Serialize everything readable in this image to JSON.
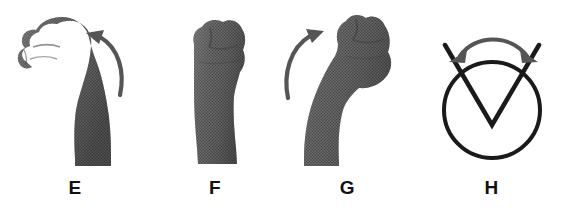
{
  "figure": {
    "background_color": "#ffffff",
    "ink_color": "#4a4a4a",
    "label_color": "#111111",
    "arrow_color": "#555555",
    "symbol_color": "#1a1a1a"
  },
  "panels": [
    {
      "id": "E",
      "label": "E",
      "subject": "fist-wrist-flexion",
      "description": "Clenched fist viewed from the radial side with the wrist bent forward in flexion",
      "has_arrow": true,
      "arrow": {
        "name": "flexion-arrow",
        "style": "curved-single-headed",
        "direction": "counterclockwise-up-left",
        "head_position": "upper-left"
      }
    },
    {
      "id": "F",
      "label": "F",
      "subject": "fist-wrist-neutral",
      "description": "Clenched fist held upright with the wrist in neutral alignment",
      "has_arrow": false
    },
    {
      "id": "G",
      "label": "G",
      "subject": "fist-wrist-extension",
      "description": "Clenched fist with the wrist bent backward in extension",
      "has_arrow": true,
      "arrow": {
        "name": "extension-arrow",
        "style": "curved-single-headed",
        "direction": "clockwise-up-right",
        "head_position": "upper-right"
      }
    },
    {
      "id": "H",
      "label": "H",
      "subject": "goniometer-angle-symbol",
      "description": "Circle crossed by a V-shaped angle with a double-headed arc arrow spanning the opening",
      "has_arrow": true,
      "arrow": {
        "name": "range-of-motion-arc",
        "style": "curved-double-headed",
        "direction": "bidirectional",
        "head_position": "both-ends"
      }
    }
  ]
}
